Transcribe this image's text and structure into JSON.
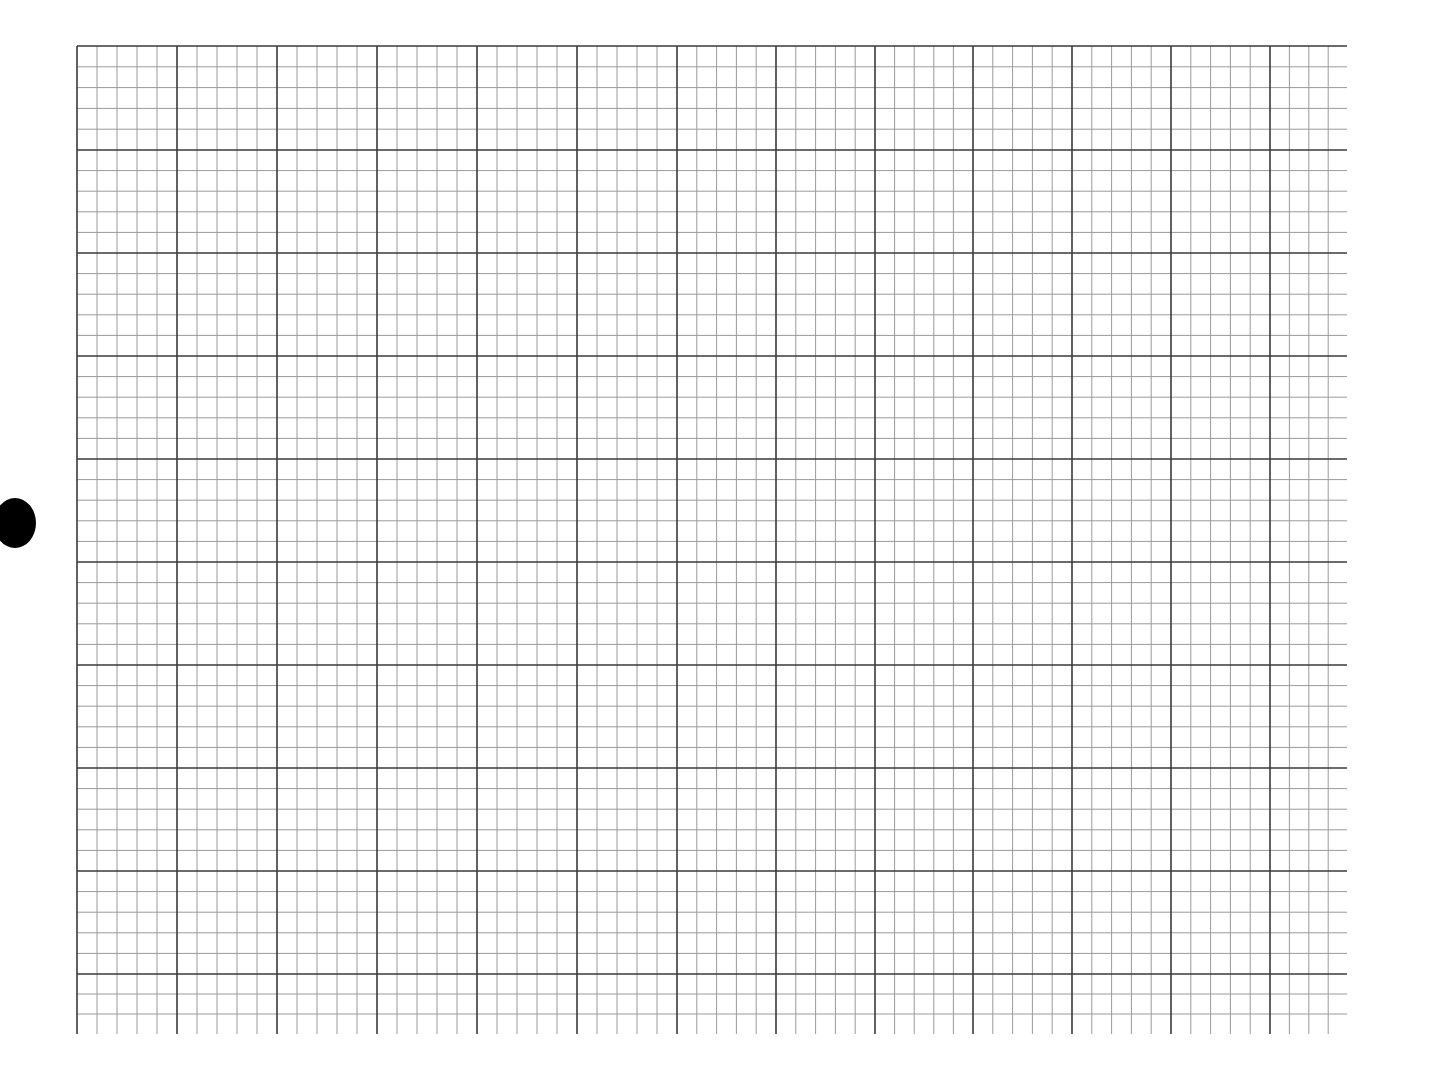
{
  "document": {
    "type": "graph paper sheet",
    "title": "Graph paper"
  },
  "grid": {
    "left": 77,
    "top": 46,
    "right": 1347,
    "bottom": 1034,
    "minor_spacing_px": 20,
    "subdivisions_per_major": 5,
    "major_x": [
      77,
      177,
      277,
      377,
      477,
      577,
      677,
      776,
      875,
      973,
      1072,
      1171,
      1270
    ],
    "major_y": [
      46,
      150,
      253,
      356,
      459,
      562,
      665,
      768,
      871,
      974
    ],
    "minor_color": "#9a9a9a",
    "major_color": "#3a3a3a",
    "background": "#ffffff"
  },
  "binder_hole": {
    "shape": "circle",
    "color": "#000000"
  }
}
